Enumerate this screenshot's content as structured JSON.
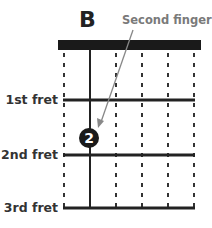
{
  "chord": {
    "name": "B",
    "annotation": "Second finger"
  },
  "frets": [
    {
      "label": "1st fret",
      "y": 100
    },
    {
      "label": "2nd fret",
      "y": 155
    },
    {
      "label": "3rd fret",
      "y": 208
    }
  ],
  "strings": {
    "count": 6,
    "x": [
      64,
      90,
      116,
      142,
      168,
      194
    ],
    "played": [
      false,
      true,
      false,
      false,
      false,
      false
    ]
  },
  "finger": {
    "number": "2",
    "string_index": 1,
    "fret": 2,
    "x": 89,
    "y": 138
  },
  "colors": {
    "nut": "#1a1a1a",
    "line": "#222222",
    "annotation": "#7a7a7a",
    "arrow": "#888888"
  }
}
